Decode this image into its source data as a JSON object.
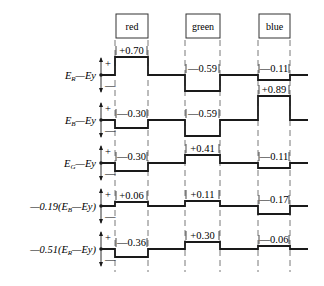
{
  "columns": [
    {
      "label": "red",
      "x0": 115,
      "x1": 148
    },
    {
      "label": "green",
      "x0": 185,
      "x1": 220
    },
    {
      "label": "blue",
      "x0": 258,
      "x1": 290
    }
  ],
  "rows": [
    {
      "label": "E_R—Ey",
      "display_main": "E",
      "display_sub": "R",
      "display_rest": "—Ey",
      "baseline": 75,
      "levels": [
        {
          "value": "+0.70",
          "offset": -18,
          "label_pos": "above"
        },
        {
          "value": "-0.59",
          "offset": 16,
          "label_pos": "above"
        },
        {
          "value": "-0.11",
          "offset": 5,
          "label_pos": "above"
        }
      ]
    },
    {
      "label": "E_B—Ey",
      "display_main": "E",
      "display_sub": "B",
      "display_rest": "—Ey",
      "baseline": 120,
      "levels": [
        {
          "value": "-0.30",
          "offset": 8,
          "label_pos": "above"
        },
        {
          "value": "-0.59",
          "offset": 16,
          "label_pos": "above"
        },
        {
          "value": "+0.89",
          "offset": -24,
          "label_pos": "above"
        }
      ]
    },
    {
      "label": "E_G—Ey",
      "display_main": "E",
      "display_sub": "G",
      "display_rest": "—Ey",
      "baseline": 163,
      "levels": [
        {
          "value": "-0.30",
          "offset": 8,
          "label_pos": "above"
        },
        {
          "value": "+0.41",
          "offset": -8,
          "label_pos": "above"
        },
        {
          "value": "-0.11",
          "offset": 5,
          "label_pos": "above"
        }
      ]
    },
    {
      "label": "-0.19(E_B—Ey)",
      "display_main": "—0.19(E",
      "display_sub": "B",
      "display_rest": "—Ey)",
      "baseline": 206,
      "levels": [
        {
          "value": "+0.06",
          "offset": -4,
          "label_pos": "above"
        },
        {
          "value": "+0.11",
          "offset": -5,
          "label_pos": "above"
        },
        {
          "value": "-0.17",
          "offset": 8,
          "label_pos": "above"
        }
      ]
    },
    {
      "label": "-0.51(E_R—Ey)",
      "display_main": "—0.51(E",
      "display_sub": "R",
      "display_rest": "—Ey)",
      "baseline": 249,
      "levels": [
        {
          "value": "-0.36",
          "offset": 8,
          "label_pos": "above"
        },
        {
          "value": "+0.30",
          "offset": -7,
          "label_pos": "above"
        },
        {
          "value": "-0.06",
          "offset": -3,
          "label_pos": "above"
        }
      ]
    }
  ],
  "axis": {
    "plus": "+",
    "minus": "—"
  },
  "colors": {
    "line": "#1a1a1a",
    "dash": "#555555",
    "box_border": "#333333"
  }
}
